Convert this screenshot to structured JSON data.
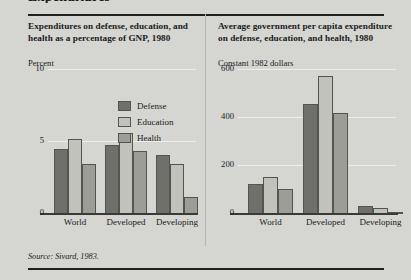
{
  "top_fragment": "Expenditures",
  "source_note": "Source: Sivard, 1983.",
  "legend": {
    "items": [
      {
        "label": "Defense",
        "color": "#6f6f6b",
        "key": "defense"
      },
      {
        "label": "Education",
        "color": "#c2c2bd",
        "key": "education"
      },
      {
        "label": "Health",
        "color": "#9d9d98",
        "key": "health"
      }
    ]
  },
  "chart_data": [
    {
      "type": "bar",
      "panel": "left",
      "title": "Expenditures on defense, education, and health as a percentage of GNP, 1980",
      "ylabel": "Percent",
      "xlabel": "",
      "categories": [
        "World",
        "Developed",
        "Developing"
      ],
      "series": [
        {
          "name": "Defense",
          "color": "#6f6f6b",
          "values": [
            4.5,
            4.8,
            4.1
          ]
        },
        {
          "name": "Education",
          "color": "#c2c2bd",
          "values": [
            5.2,
            5.6,
            3.5
          ]
        },
        {
          "name": "Health",
          "color": "#9d9d98",
          "values": [
            3.5,
            4.4,
            1.2
          ]
        }
      ],
      "ylim": [
        0,
        10
      ],
      "yticks": [
        0,
        5,
        10
      ],
      "ytick_labels": [
        "0",
        "5",
        "10"
      ],
      "grid": true,
      "legend_position": "inside-top-right"
    },
    {
      "type": "bar",
      "panel": "right",
      "title": "Average government per capita expenditure on defense, education, and health, 1980",
      "ylabel": "Constant 1982 dollars",
      "xlabel": "",
      "categories": [
        "World",
        "Developed",
        "Developing"
      ],
      "series": [
        {
          "name": "Defense",
          "color": "#6f6f6b",
          "values": [
            125,
            460,
            35
          ]
        },
        {
          "name": "Education",
          "color": "#c2c2bd",
          "values": [
            155,
            575,
            25
          ]
        },
        {
          "name": "Health",
          "color": "#9d9d98",
          "values": [
            105,
            420,
            8
          ]
        }
      ],
      "ylim": [
        0,
        600
      ],
      "yticks": [
        0,
        200,
        400,
        600
      ],
      "ytick_labels": [
        "0",
        "200",
        "400",
        "600"
      ],
      "grid": true,
      "legend_position": "shared-with-left-panel"
    }
  ]
}
